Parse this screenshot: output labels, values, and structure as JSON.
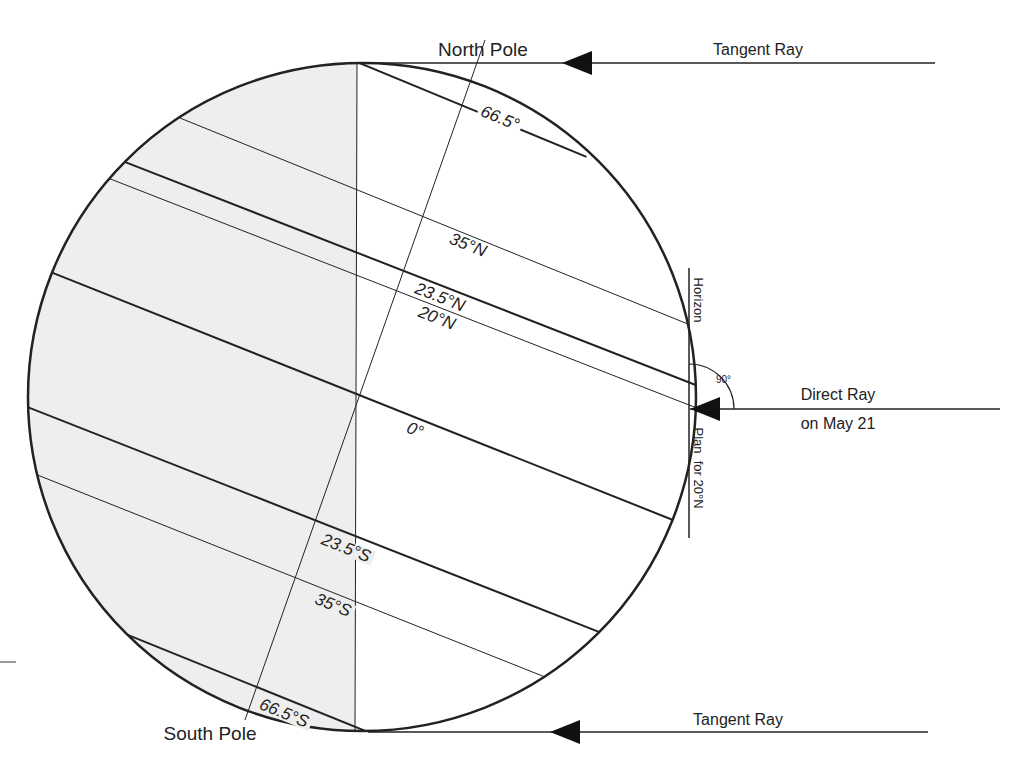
{
  "diagram": {
    "colors": {
      "line": "#222222",
      "shade": "#eeeeee",
      "background": "#ffffff"
    },
    "globe": {
      "cx": 362,
      "cy": 397,
      "r": 334
    },
    "labels": {
      "north_pole": "North Pole",
      "south_pole": "South Pole",
      "tangent_ray_top": "Tangent Ray",
      "tangent_ray_bottom": "Tangent Ray",
      "direct_ray_line1": "Direct Ray",
      "direct_ray_line2": "on May 21",
      "horizon": "Horizon",
      "plan": "Plan  for 20°N",
      "right_angle": "90°"
    },
    "latitudes": [
      {
        "name": "66.5N",
        "label": "66.5°",
        "weight": "thick",
        "x1": 357,
        "y1": 62,
        "x2": 582,
        "y2": 155,
        "lx": 500,
        "ly": 118
      },
      {
        "name": "35N",
        "label": "35°N",
        "weight": "thin",
        "x1": 180,
        "y1": 118,
        "x2": 678,
        "y2": 320,
        "lx": 468,
        "ly": 245
      },
      {
        "name": "23.5N",
        "label": "23.5°N",
        "weight": "thick",
        "x1": 125,
        "y1": 162,
        "x2": 688,
        "y2": 382,
        "lx": 440,
        "ly": 297
      },
      {
        "name": "20N",
        "label": "20°N",
        "weight": "thin",
        "x1": 113,
        "y1": 180,
        "x2": 689,
        "y2": 405,
        "lx": 437,
        "ly": 318
      },
      {
        "name": "equator",
        "label": "0°",
        "weight": "thick",
        "x1": 58,
        "y1": 275,
        "x2": 668,
        "y2": 518,
        "lx": 415,
        "ly": 430
      },
      {
        "name": "23.5S",
        "label": "23.5°S",
        "weight": "thick",
        "x1": 35,
        "y1": 410,
        "x2": 594,
        "y2": 630,
        "lx": 346,
        "ly": 548
      },
      {
        "name": "35S",
        "label": "35°S",
        "weight": "thin",
        "x1": 45,
        "y1": 478,
        "x2": 540,
        "y2": 675,
        "lx": 333,
        "ly": 605
      },
      {
        "name": "66.5S",
        "label": "66.5°S",
        "weight": "thick",
        "x1": 133,
        "y1": 637,
        "x2": 368,
        "y2": 732,
        "lx": 284,
        "ly": 713
      }
    ],
    "axis": {
      "x1": 485,
      "y1": 40,
      "x2": 245,
      "y2": 720
    },
    "terminator": {
      "x1": 357,
      "y1": 62,
      "x2": 355,
      "y2": 732
    },
    "rays": [
      {
        "name": "tangent-ray-top",
        "x1": 935,
        "y1": 63,
        "x2": 357,
        "y2": 63,
        "arrow_x": 562
      },
      {
        "name": "direct-ray",
        "x1": 1000,
        "y1": 409,
        "x2": 690,
        "y2": 409,
        "arrow_x": 690
      },
      {
        "name": "tangent-ray-bottom",
        "x1": 928,
        "y1": 732,
        "x2": 368,
        "y2": 732,
        "arrow_x": 548
      }
    ],
    "horizon_line": {
      "x": 689,
      "y1": 268,
      "y2": 538
    }
  }
}
